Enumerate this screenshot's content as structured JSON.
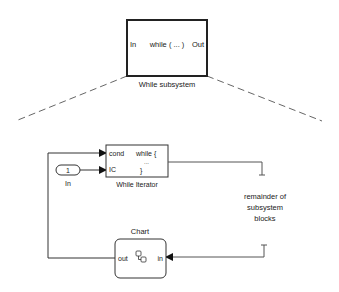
{
  "top_block": {
    "in_port": "In",
    "body": "while ( ... )",
    "out_port": "Out",
    "caption": "While subsystem"
  },
  "inport_block": {
    "number": "1",
    "caption": "In"
  },
  "while_iterator": {
    "cond_port": "cond",
    "ic_port": "IC",
    "line1": "while {",
    "line2": "...",
    "line3": "}",
    "caption": "While Iterator"
  },
  "remainder": {
    "line1": "remainder of",
    "line2": "subsystem",
    "line3": "blocks"
  },
  "chart_block": {
    "caption": "Chart",
    "out_port": "out",
    "in_port": "in",
    "icon": "stateflow-icon"
  },
  "colors": {
    "line": "#333333",
    "dashed": "#666666",
    "block_border": "#222222"
  }
}
